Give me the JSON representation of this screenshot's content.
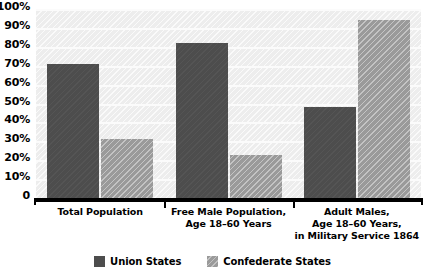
{
  "chart_data": {
    "type": "bar",
    "title": "",
    "xlabel": "",
    "ylabel": "",
    "ylim": [
      0,
      100
    ],
    "grid": true,
    "legend_position": "bottom-center",
    "categories": [
      "Total Population",
      "Free Male Population, Age 18–60 Years",
      "Adult Males, Age 18–60 Years, in Military Service 1864"
    ],
    "category_lines": [
      [
        "Total Population"
      ],
      [
        "Free Male Population,",
        "Age 18–60 Years"
      ],
      [
        "Adult Males,",
        "Age 18–60 Years,",
        "in Military Service 1864"
      ]
    ],
    "series": [
      {
        "name": "Union States",
        "color": "#4d4d4d",
        "values": [
          71,
          82,
          48
        ]
      },
      {
        "name": "Confederate States",
        "color": "#9a9a9a",
        "values": [
          31,
          23,
          94
        ]
      }
    ],
    "y_ticks": [
      {
        "label": "100%",
        "value": 100
      },
      {
        "label": "90%",
        "value": 90
      },
      {
        "label": "80%",
        "value": 80
      },
      {
        "label": "70%",
        "value": 70
      },
      {
        "label": "60%",
        "value": 60
      },
      {
        "label": "50%",
        "value": 50
      },
      {
        "label": "40%",
        "value": 40
      },
      {
        "label": "30%",
        "value": 30
      },
      {
        "label": "20%",
        "value": 20
      },
      {
        "label": "10%",
        "value": 10
      },
      {
        "label": "0",
        "value": 0
      }
    ]
  },
  "legend": {
    "items": [
      {
        "label": "Union States",
        "swatch": "union-swatch-icon"
      },
      {
        "label": "Confederate States",
        "swatch": "confederate-swatch-icon"
      }
    ]
  },
  "title_sliver": {
    "text": " "
  },
  "colors": {
    "union": "#4d4d4d",
    "confederate": "#9a9a9a",
    "plot_background": "#ededed",
    "gridline": "#fbfbfb",
    "axis": "#000000",
    "text": "#000000"
  }
}
